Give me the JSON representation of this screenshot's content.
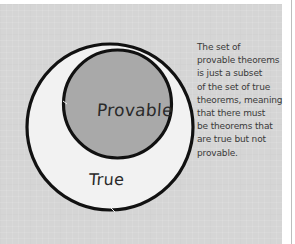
{
  "diagram": {
    "type": "nested-set-diagram",
    "outer_set": {
      "label": "True",
      "fill": "#f2f2f2",
      "stroke": "#111111"
    },
    "inner_set": {
      "label": "Provable",
      "fill": "#a9a9a9",
      "stroke": "#111111"
    },
    "background": "#d5d5d5",
    "annotation": {
      "lines": [
        "The set of",
        "provable theorems",
        "is just a subset",
        "of the set of true",
        "theorems, meaning",
        "that there must",
        "be theorems that",
        "are true but not",
        "provable."
      ]
    }
  }
}
